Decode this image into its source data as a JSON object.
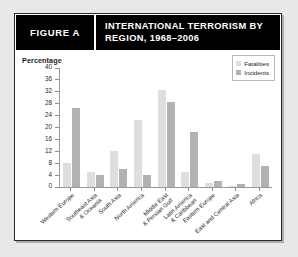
{
  "figure": {
    "label": "FIGURE A",
    "title": "INTERNATIONAL TERRORISM BY REGION, 1968–2006"
  },
  "legend": {
    "position": "top-right",
    "items": [
      {
        "name": "Fatalities",
        "color": "#dedede"
      },
      {
        "name": "Incidents",
        "color": "#b2b2b2"
      }
    ]
  },
  "chart_data": {
    "type": "bar",
    "title": "INTERNATIONAL TERRORISM BY REGION, 1968–2006",
    "xlabel": "",
    "ylabel": "Percentage",
    "ylim": [
      0,
      40
    ],
    "yticks": [
      0,
      4,
      8,
      12,
      16,
      20,
      24,
      28,
      32,
      36,
      40
    ],
    "grid": false,
    "legend_position": "top-right",
    "categories": [
      "Western Europe",
      "Southeast Asia & Oceania",
      "South Asia",
      "North America",
      "Middle East & Persian Gulf",
      "Latin America & Caribbean",
      "Eastern Europe",
      "East and Central Asia",
      "Africa"
    ],
    "series": [
      {
        "name": "Fatalities",
        "color": "#dedede",
        "values": [
          8,
          5,
          12,
          22.5,
          32.5,
          5,
          1.5,
          0.5,
          11
        ]
      },
      {
        "name": "Incidents",
        "color": "#b2b2b2",
        "values": [
          26.5,
          4,
          6,
          4,
          28.5,
          18.5,
          2,
          1,
          7
        ]
      }
    ]
  }
}
